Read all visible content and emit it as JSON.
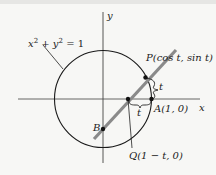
{
  "diagram": {
    "labels": {
      "equation_x": "x",
      "equation_rest_1": "2",
      "equation_plus": " + ",
      "equation_y": "y",
      "equation_rest_2": "2",
      "equation_eq": " = 1",
      "y_axis": "y",
      "x_axis": "x",
      "point_P": "P(cos t, sin t)",
      "point_A": "A(1, 0)",
      "point_B": "B",
      "point_Q": "Q(1 − t, 0)",
      "arc_t": "t",
      "segment_t": "t"
    },
    "colors": {
      "ink": "#1a1a1a",
      "line": "#8a8a8a",
      "background": "#f7f7f5"
    }
  }
}
